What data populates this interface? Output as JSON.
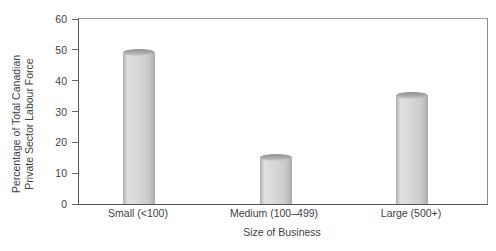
{
  "chart_data": {
    "type": "bar",
    "title": "",
    "categories": [
      "Small (<100)",
      "Medium (100–499)",
      "Large (500+)"
    ],
    "values": [
      50,
      16,
      36
    ],
    "xlabel": "Size of Business",
    "ylabel": "Percentage of Total Canadian Private Sector Labour Force",
    "ylabel_lines": [
      "Percentage of Total Canadian",
      "Private Sector Labour Force"
    ],
    "ylim": [
      0,
      60
    ],
    "ytick_values": [
      60,
      50,
      40,
      30,
      20,
      10,
      0
    ],
    "ytick_labels": [
      "60",
      "50",
      "40",
      "30",
      "20",
      "10",
      "0"
    ],
    "grid": false,
    "legend": false,
    "bar_style": "3d-cylinder",
    "colors": {
      "bar_fill": "#d7d7d7",
      "bar_edge": "#b0b0b0",
      "bar_cap": "#8f8f8f",
      "axis_line": "#6a6a6a",
      "text": "#3f3f3f",
      "background": "#ffffff"
    }
  }
}
